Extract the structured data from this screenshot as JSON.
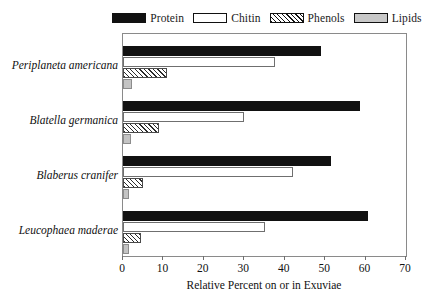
{
  "chart_data": {
    "type": "bar",
    "orientation": "horizontal",
    "title": "",
    "xlabel": "Relative Percent on or in Exuviae",
    "ylabel": "",
    "xlim": [
      0,
      70
    ],
    "xticks": [
      0,
      10,
      20,
      30,
      40,
      50,
      60,
      70
    ],
    "grid": false,
    "legend_position": "top-center",
    "categories": [
      "Periplaneta americana",
      "Blatella germanica",
      "Blaberus cranifer",
      "Leucophaea maderae"
    ],
    "series": [
      {
        "name": "Protein",
        "color": "#111111",
        "fill": "solid",
        "values": [
          49.0,
          58.5,
          51.5,
          60.5
        ]
      },
      {
        "name": "Chitin",
        "color": "#ffffff",
        "fill": "open",
        "values": [
          37.5,
          30.0,
          42.0,
          35.0
        ]
      },
      {
        "name": "Phenols",
        "color": "#2b2b2b",
        "fill": "hatched",
        "values": [
          11.0,
          9.0,
          5.0,
          4.5
        ]
      },
      {
        "name": "Lipids",
        "color": "#c4c4c4",
        "fill": "gray",
        "values": [
          2.2,
          2.0,
          1.5,
          1.5
        ]
      }
    ]
  },
  "legend": {
    "items": [
      {
        "label": "Protein"
      },
      {
        "label": "Chitin"
      },
      {
        "label": "Phenols"
      },
      {
        "label": "Lipids"
      }
    ]
  }
}
